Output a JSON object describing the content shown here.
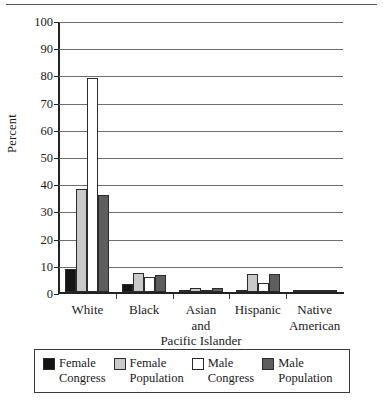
{
  "chart_data": {
    "type": "bar",
    "title": "",
    "xlabel": "",
    "ylabel": "Percent",
    "ylim": [
      0,
      100
    ],
    "ytick_step": 10,
    "yticks": [
      0,
      10,
      20,
      30,
      40,
      50,
      60,
      70,
      80,
      90,
      100
    ],
    "grid": true,
    "legend_position": "bottom",
    "categories": [
      "White",
      "Black",
      "Asian\nand\nPacific Islander",
      "Hispanic",
      "Native\nAmerican"
    ],
    "series": [
      {
        "name": "Female\nCongress",
        "color": "#141414",
        "values": [
          8.5,
          3.0,
          0.5,
          1.0,
          0.2
        ]
      },
      {
        "name": "Female\nPopulation",
        "color": "#c9c9c9",
        "values": [
          38.0,
          7.2,
          1.8,
          6.8,
          0.4
        ]
      },
      {
        "name": "Male\nCongress",
        "color": "#ffffff",
        "values": [
          79.0,
          5.8,
          0.8,
          3.6,
          0.2
        ]
      },
      {
        "name": "Male\nPopulation",
        "color": "#5e5e5e",
        "values": [
          36.0,
          6.5,
          1.8,
          6.8,
          0.5
        ]
      }
    ]
  },
  "axis": {
    "ylabel": "Percent",
    "tick_labels": [
      "100",
      "90",
      "80",
      "70",
      "60",
      "50",
      "40",
      "30",
      "20",
      "10",
      "0"
    ]
  },
  "legend": {
    "entries": [
      {
        "label": "Female\nCongress",
        "color": "#141414"
      },
      {
        "label": "Female\nPopulation",
        "color": "#c9c9c9"
      },
      {
        "label": "Male\nCongress",
        "color": "#ffffff"
      },
      {
        "label": "Male\nPopulation",
        "color": "#5e5e5e"
      }
    ]
  }
}
